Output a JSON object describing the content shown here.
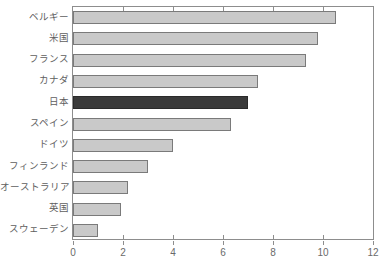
{
  "chart_data": {
    "type": "bar",
    "orientation": "horizontal",
    "title": "",
    "xlabel": "",
    "ylabel": "",
    "xlim": [
      0,
      12
    ],
    "xticks": [
      0,
      2,
      4,
      6,
      8,
      10,
      12
    ],
    "grid": false,
    "legend": "none",
    "categories": [
      "ベルギー",
      "米国",
      "フランス",
      "カナダ",
      "日本",
      "スペイン",
      "ドイツ",
      "フィンランド",
      "オーストラリア",
      "英国",
      "スウェーデン"
    ],
    "values": [
      10.5,
      9.8,
      9.3,
      7.4,
      7.0,
      6.3,
      4.0,
      3.0,
      2.2,
      1.9,
      1.0
    ],
    "highlight_index": 4,
    "colors": {
      "bar_fill": "#c9c9c9",
      "bar_border": "#7a7a7a",
      "highlight_fill": "#3a3a3a",
      "highlight_border": "#2a2a2a",
      "axis": "#8d8d8d",
      "label_text": "#5e5e5e",
      "tick_text": "#6a6a6a",
      "background": "#ffffff"
    }
  }
}
